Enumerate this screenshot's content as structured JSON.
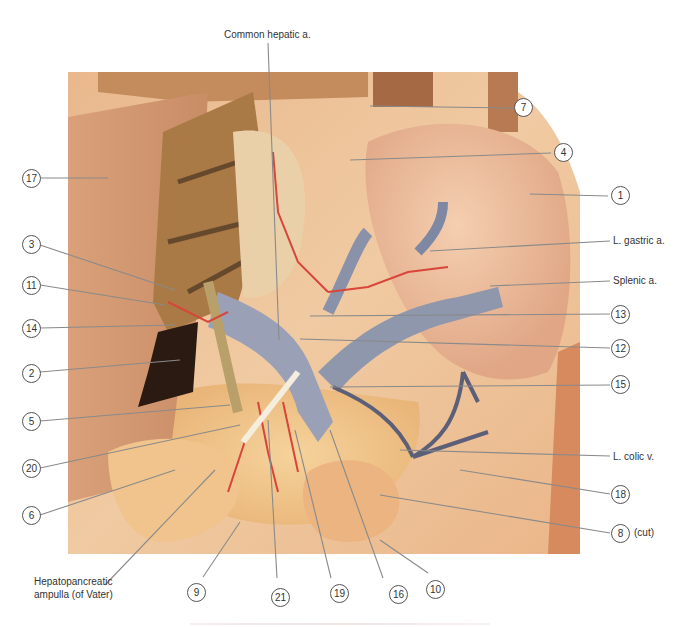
{
  "figure": {
    "colors": {
      "background": "#ffffff",
      "tissue_light": "#f1c9a0",
      "tissue_mid": "#e3a679",
      "liver_brown": "#a97a45",
      "vein_blue": "#8d95ad",
      "artery_red": "#d8453a",
      "leader_line": "#8a8a8a",
      "label_circle": "#555555"
    }
  },
  "labels": {
    "top": {
      "text": "Common hepatic a."
    },
    "right": [
      {
        "id": "7",
        "text": "7"
      },
      {
        "id": "4",
        "text": "4"
      },
      {
        "id": "1",
        "text": "1"
      },
      {
        "id": "l-gastric",
        "text": "L. gastric a."
      },
      {
        "id": "splenic",
        "text": "Splenic a."
      },
      {
        "id": "13",
        "text": "13"
      },
      {
        "id": "12",
        "text": "12"
      },
      {
        "id": "15",
        "text": "15"
      },
      {
        "id": "l-colic",
        "text": "L. colic v."
      },
      {
        "id": "18",
        "text": "18"
      },
      {
        "id": "8",
        "text": "8",
        "suffix": "(cut)"
      }
    ],
    "left": [
      {
        "id": "17",
        "text": "17"
      },
      {
        "id": "3",
        "text": "3"
      },
      {
        "id": "11",
        "text": "11"
      },
      {
        "id": "14",
        "text": "14"
      },
      {
        "id": "2",
        "text": "2"
      },
      {
        "id": "5",
        "text": "5"
      },
      {
        "id": "20",
        "text": "20"
      },
      {
        "id": "6",
        "text": "6"
      }
    ],
    "bottom": [
      {
        "id": "hepatopancreatic",
        "text_line1": "Hepatopancreatic",
        "text_line2": "ampulla (of Vater)"
      },
      {
        "id": "9",
        "text": "9"
      },
      {
        "id": "21",
        "text": "21"
      },
      {
        "id": "19",
        "text": "19"
      },
      {
        "id": "16",
        "text": "16"
      },
      {
        "id": "10",
        "text": "10"
      }
    ]
  }
}
